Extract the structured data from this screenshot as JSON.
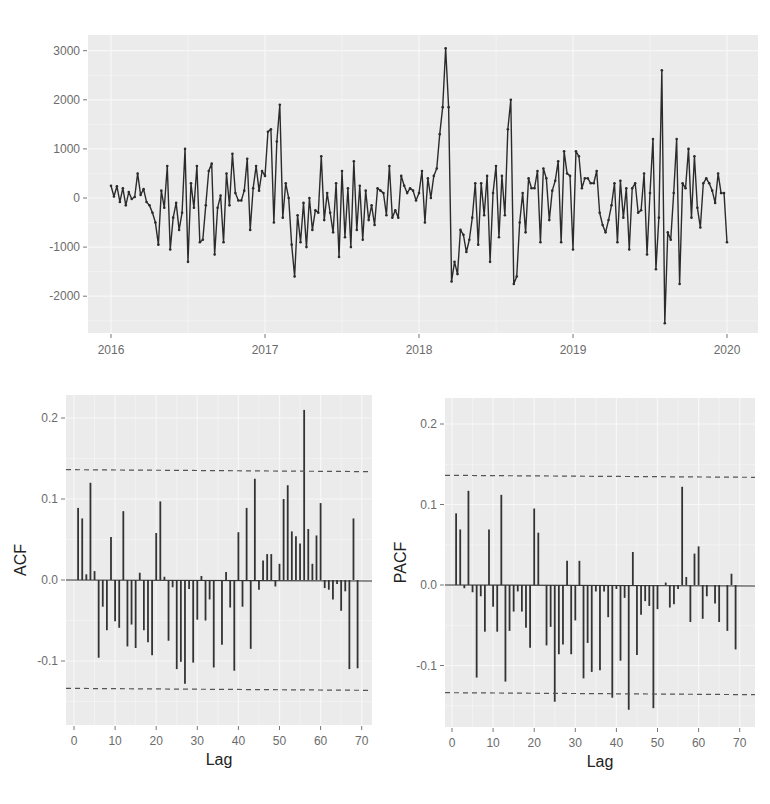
{
  "chart_data": [
    {
      "id": "timeseries",
      "type": "line",
      "title": "",
      "xlabel": "",
      "ylabel": "",
      "x_ticks": [
        "2016",
        "2017",
        "2018",
        "2019",
        "2020"
      ],
      "y_ticks": [
        "3000",
        "2000",
        "1000",
        "0",
        "-1000",
        "-2000"
      ],
      "xlim": [
        2016,
        2020
      ],
      "ylim": [
        -2600,
        3100
      ],
      "grid": true,
      "markers": true,
      "line_color": "#2b2b2b",
      "start": 2016.0,
      "end": 2020.0,
      "values": [
        250,
        30,
        240,
        -80,
        200,
        -150,
        120,
        -20,
        20,
        500,
        60,
        180,
        -80,
        -150,
        -300,
        -500,
        -950,
        150,
        -200,
        650,
        -1050,
        -400,
        -100,
        -650,
        -300,
        1000,
        -1300,
        300,
        -200,
        650,
        -900,
        -850,
        -150,
        550,
        700,
        -1150,
        -200,
        50,
        -900,
        500,
        -150,
        900,
        100,
        -50,
        -50,
        150,
        800,
        -650,
        200,
        650,
        150,
        550,
        450,
        1350,
        1400,
        -500,
        1150,
        1900,
        -400,
        300,
        0,
        -950,
        -1600,
        -350,
        -900,
        -100,
        -1000,
        0,
        -650,
        -250,
        -300,
        850,
        -450,
        100,
        -300,
        -700,
        300,
        -1200,
        550,
        -800,
        200,
        -1000,
        750,
        -650,
        250,
        -850,
        150,
        -450,
        -150,
        -550,
        200,
        150,
        100,
        -350,
        650,
        -400,
        -250,
        -400,
        450,
        250,
        100,
        200,
        150,
        -50,
        100,
        550,
        -500,
        400,
        0,
        450,
        600,
        1300,
        1850,
        3050,
        1850,
        -1700,
        -1300,
        -1550,
        -650,
        -750,
        -1100,
        -850,
        -400,
        300,
        -950,
        300,
        -350,
        450,
        -1300,
        100,
        650,
        -800,
        450,
        -350,
        1400,
        2000,
        -1750,
        -1600,
        -500,
        100,
        -700,
        400,
        200,
        200,
        550,
        -900,
        600,
        400,
        -450,
        150,
        350,
        750,
        -900,
        950,
        500,
        450,
        -1050,
        950,
        850,
        200,
        400,
        400,
        300,
        300,
        550,
        -300,
        -550,
        -700,
        -450,
        -150,
        300,
        -900,
        350,
        -400,
        200,
        -1050,
        200,
        300,
        -300,
        -250,
        500,
        -1150,
        100,
        1200,
        -1450,
        -400,
        2600,
        -2550,
        -700,
        -850,
        100,
        1200,
        -1750,
        300,
        200,
        1000,
        -400,
        850,
        -200,
        -600,
        300,
        400,
        300,
        150,
        -100,
        500,
        100,
        100,
        -900
      ]
    },
    {
      "id": "acf",
      "type": "bar",
      "title": "",
      "xlabel": "Lag",
      "ylabel": "ACF",
      "x_ticks": [
        "0",
        "10",
        "20",
        "30",
        "40",
        "50",
        "60",
        "70"
      ],
      "y_ticks": [
        "0.2",
        "0.1",
        "0.0",
        "-0.1"
      ],
      "xlim": [
        -1,
        72
      ],
      "ylim": [
        -0.175,
        0.235
      ],
      "grid": true,
      "ci_upper": 0.135,
      "ci_lower": -0.135,
      "lags": [
        1,
        2,
        3,
        4,
        5,
        6,
        7,
        8,
        9,
        10,
        11,
        12,
        13,
        14,
        15,
        16,
        17,
        18,
        19,
        20,
        21,
        22,
        23,
        24,
        25,
        26,
        27,
        28,
        29,
        30,
        31,
        32,
        33,
        34,
        35,
        36,
        37,
        38,
        39,
        40,
        41,
        42,
        43,
        44,
        45,
        46,
        47,
        48,
        49,
        50,
        51,
        52,
        53,
        54,
        55,
        56,
        57,
        58,
        59,
        60,
        61,
        62,
        63,
        64,
        65,
        66,
        67,
        68,
        69
      ],
      "values": [
        0.089,
        0.076,
        0.007,
        0.12,
        0.011,
        -0.096,
        -0.033,
        -0.062,
        0.053,
        -0.051,
        -0.059,
        0.085,
        -0.082,
        -0.055,
        -0.084,
        0.009,
        -0.062,
        -0.077,
        -0.093,
        0.058,
        0.097,
        0.004,
        -0.075,
        -0.009,
        -0.11,
        -0.101,
        -0.128,
        -0.011,
        -0.102,
        -0.049,
        0.005,
        -0.05,
        -0.024,
        -0.108,
        0.0,
        -0.08,
        0.01,
        -0.034,
        -0.112,
        0.059,
        -0.033,
        0.089,
        -0.085,
        0.125,
        -0.012,
        0.024,
        0.032,
        0.032,
        -0.008,
        0.02,
        0.1,
        0.117,
        0.06,
        0.054,
        0.045,
        0.21,
        0.063,
        0.02,
        0.055,
        0.095,
        -0.01,
        -0.012,
        -0.024,
        -0.005,
        -0.038,
        -0.014,
        -0.11,
        0.076,
        -0.109
      ]
    },
    {
      "id": "pacf",
      "type": "bar",
      "title": "",
      "xlabel": "Lag",
      "ylabel": "PACF",
      "x_ticks": [
        "0",
        "10",
        "20",
        "30",
        "40",
        "50",
        "60",
        "70"
      ],
      "y_ticks": [
        "0.2",
        "0.1",
        "0.0",
        "-0.1"
      ],
      "xlim": [
        -1,
        72
      ],
      "ylim": [
        -0.175,
        0.235
      ],
      "grid": true,
      "ci_upper": 0.135,
      "ci_lower": -0.135,
      "lags": [
        1,
        2,
        3,
        4,
        5,
        6,
        7,
        8,
        9,
        10,
        11,
        12,
        13,
        14,
        15,
        16,
        17,
        18,
        19,
        20,
        21,
        22,
        23,
        24,
        25,
        26,
        27,
        28,
        29,
        30,
        31,
        32,
        33,
        34,
        35,
        36,
        37,
        38,
        39,
        40,
        41,
        42,
        43,
        44,
        45,
        46,
        47,
        48,
        49,
        50,
        51,
        52,
        53,
        54,
        55,
        56,
        57,
        58,
        59,
        60,
        61,
        62,
        63,
        64,
        65,
        66,
        67,
        68,
        69
      ],
      "values": [
        0.089,
        0.069,
        -0.004,
        0.117,
        -0.009,
        -0.115,
        -0.014,
        -0.058,
        0.069,
        -0.027,
        -0.058,
        0.112,
        -0.12,
        -0.057,
        -0.033,
        -0.008,
        -0.033,
        -0.053,
        -0.078,
        0.095,
        0.065,
        0.0,
        -0.075,
        -0.052,
        -0.145,
        -0.086,
        -0.074,
        0.03,
        -0.086,
        -0.044,
        0.03,
        -0.116,
        -0.072,
        -0.108,
        -0.008,
        -0.106,
        -0.008,
        -0.04,
        -0.14,
        -0.005,
        -0.094,
        -0.016,
        -0.155,
        0.041,
        -0.087,
        -0.037,
        -0.02,
        -0.026,
        -0.153,
        -0.03,
        0.0,
        0.003,
        -0.028,
        -0.024,
        -0.005,
        0.122,
        0.01,
        -0.046,
        0.039,
        0.048,
        -0.042,
        -0.014,
        0.0,
        -0.023,
        -0.046,
        0.0,
        -0.057,
        0.014,
        -0.08
      ]
    }
  ],
  "colors": {
    "panel_bg": "#ebebeb",
    "grid": "#f7f7f7",
    "line": "#2b2b2b",
    "tick_text": "#6b6b6b",
    "ci": "#555555"
  }
}
